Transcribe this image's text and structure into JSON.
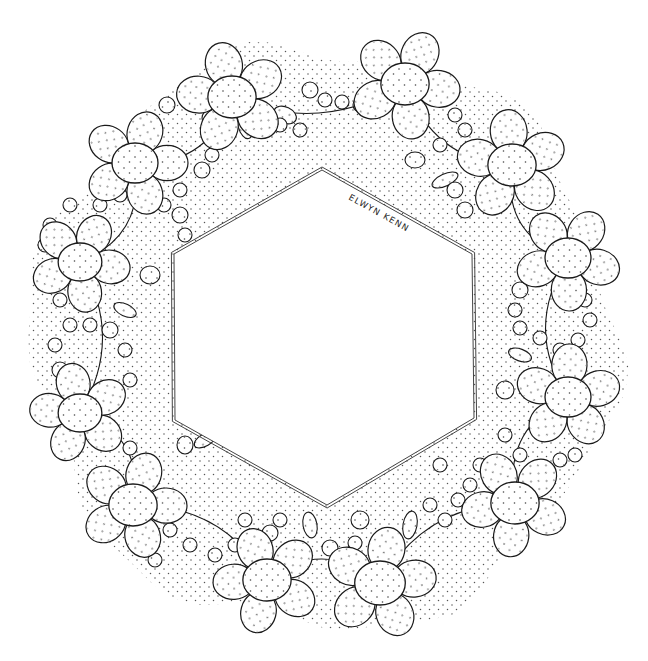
{
  "artwork": {
    "title": "Hexagonal floral wreath line drawing",
    "signature": "ELWYN KENN",
    "clipped_header_text": "— ·  ·· ·  ·   ·",
    "colors": {
      "ink": "#1a1a1a",
      "stipple": "#555555",
      "paper": "#ffffff",
      "frame": "#444444"
    },
    "hexagon": [
      [
        322,
        170
      ],
      [
        472,
        254
      ],
      [
        474,
        418
      ],
      [
        327,
        505
      ],
      [
        175,
        420
      ],
      [
        174,
        254
      ]
    ],
    "flowers": [
      {
        "cx": 135,
        "cy": 163,
        "r": 20,
        "pr": 22
      },
      {
        "cx": 232,
        "cy": 97,
        "r": 21,
        "pr": 23
      },
      {
        "cx": 405,
        "cy": 84,
        "r": 21,
        "pr": 23
      },
      {
        "cx": 512,
        "cy": 165,
        "r": 21,
        "pr": 23
      },
      {
        "cx": 568,
        "cy": 258,
        "r": 20,
        "pr": 22
      },
      {
        "cx": 568,
        "cy": 397,
        "r": 20,
        "pr": 22
      },
      {
        "cx": 515,
        "cy": 503,
        "r": 21,
        "pr": 22
      },
      {
        "cx": 380,
        "cy": 583,
        "r": 22,
        "pr": 23
      },
      {
        "cx": 267,
        "cy": 580,
        "r": 21,
        "pr": 22
      },
      {
        "cx": 133,
        "cy": 505,
        "r": 21,
        "pr": 22
      },
      {
        "cx": 80,
        "cy": 413,
        "r": 19,
        "pr": 21
      },
      {
        "cx": 80,
        "cy": 262,
        "r": 19,
        "pr": 21
      }
    ],
    "beads": [
      [
        167,
        105,
        8
      ],
      [
        185,
        95,
        8
      ],
      [
        203,
        90,
        7
      ],
      [
        210,
        118,
        8
      ],
      [
        213,
        138,
        8
      ],
      [
        212,
        155,
        7
      ],
      [
        202,
        170,
        8
      ],
      [
        180,
        190,
        7
      ],
      [
        164,
        205,
        7
      ],
      [
        310,
        90,
        8
      ],
      [
        325,
        100,
        7
      ],
      [
        342,
        102,
        7
      ],
      [
        360,
        105,
        7
      ],
      [
        280,
        125,
        7
      ],
      [
        300,
        130,
        7
      ],
      [
        455,
        115,
        7
      ],
      [
        465,
        130,
        7
      ],
      [
        440,
        145,
        7
      ],
      [
        455,
        190,
        8
      ],
      [
        465,
        210,
        8
      ],
      [
        495,
        200,
        7
      ],
      [
        520,
        290,
        8
      ],
      [
        515,
        310,
        7
      ],
      [
        520,
        328,
        7
      ],
      [
        540,
        338,
        7
      ],
      [
        560,
        350,
        7
      ],
      [
        578,
        340,
        7
      ],
      [
        590,
        320,
        7
      ],
      [
        585,
        300,
        7
      ],
      [
        505,
        435,
        7
      ],
      [
        520,
        455,
        7
      ],
      [
        480,
        465,
        7
      ],
      [
        470,
        485,
        7
      ],
      [
        458,
        500,
        7
      ],
      [
        445,
        520,
        7
      ],
      [
        430,
        505,
        7
      ],
      [
        440,
        465,
        7
      ],
      [
        330,
        548,
        8
      ],
      [
        355,
        543,
        7
      ],
      [
        270,
        533,
        8
      ],
      [
        280,
        520,
        7
      ],
      [
        245,
        520,
        7
      ],
      [
        235,
        545,
        7
      ],
      [
        215,
        555,
        7
      ],
      [
        190,
        545,
        7
      ],
      [
        170,
        530,
        7
      ],
      [
        150,
        475,
        7
      ],
      [
        60,
        370,
        8
      ],
      [
        55,
        345,
        7
      ],
      [
        70,
        325,
        7
      ],
      [
        90,
        325,
        7
      ],
      [
        110,
        330,
        8
      ],
      [
        125,
        350,
        7
      ],
      [
        130,
        380,
        7
      ],
      [
        60,
        300,
        7
      ],
      [
        55,
        285,
        7
      ],
      [
        45,
        245,
        7
      ],
      [
        50,
        225,
        7
      ],
      [
        70,
        205,
        7
      ],
      [
        100,
        205,
        7
      ],
      [
        120,
        195,
        7
      ],
      [
        180,
        215,
        8
      ],
      [
        185,
        235,
        7
      ],
      [
        130,
        448,
        7
      ],
      [
        120,
        520,
        7
      ],
      [
        155,
        560,
        7
      ],
      [
        545,
        470,
        7
      ],
      [
        560,
        460,
        7
      ],
      [
        575,
        455,
        7
      ]
    ],
    "leaves": [
      {
        "x": 245,
        "y": 125,
        "rx": 7,
        "ry": 14,
        "rot": -15
      },
      {
        "x": 285,
        "y": 115,
        "rx": 12,
        "ry": 8,
        "rot": 25
      },
      {
        "x": 445,
        "y": 180,
        "rx": 14,
        "ry": 6,
        "rot": -25
      },
      {
        "x": 415,
        "y": 160,
        "rx": 10,
        "ry": 8,
        "rot": 0
      },
      {
        "x": 520,
        "y": 355,
        "rx": 12,
        "ry": 6,
        "rot": 20
      },
      {
        "x": 505,
        "y": 390,
        "rx": 9,
        "ry": 9,
        "rot": 0
      },
      {
        "x": 125,
        "y": 310,
        "rx": 12,
        "ry": 6,
        "rot": 25
      },
      {
        "x": 150,
        "y": 275,
        "rx": 10,
        "ry": 9,
        "rot": 0
      },
      {
        "x": 205,
        "y": 440,
        "rx": 12,
        "ry": 6,
        "rot": -30
      },
      {
        "x": 410,
        "y": 525,
        "rx": 7,
        "ry": 14,
        "rot": 10
      },
      {
        "x": 360,
        "y": 520,
        "rx": 9,
        "ry": 9,
        "rot": 0
      },
      {
        "x": 310,
        "y": 525,
        "rx": 7,
        "ry": 13,
        "rot": -10
      },
      {
        "x": 185,
        "y": 445,
        "rx": 8,
        "ry": 9,
        "rot": 0
      }
    ]
  }
}
